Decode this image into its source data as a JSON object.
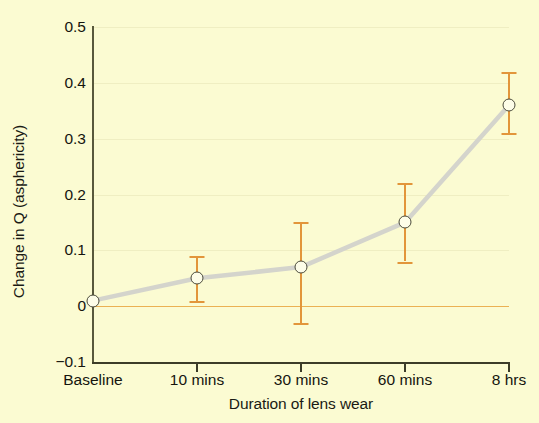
{
  "chart_data": {
    "type": "line",
    "title": "",
    "xlabel": "Duration of lens wear",
    "ylabel": "Change in Q (asphericity)",
    "categories": [
      "Baseline",
      "10 mins",
      "30 mins",
      "60 mins",
      "8 hrs"
    ],
    "values": [
      0.01,
      0.05,
      0.07,
      0.15,
      0.36
    ],
    "error_upper": [
      0.01,
      0.09,
      0.15,
      0.22,
      0.42
    ],
    "error_lower": [
      0.01,
      0.01,
      -0.03,
      0.08,
      0.31
    ],
    "ylim": [
      -0.1,
      0.5
    ],
    "yticks": [
      -0.1,
      0,
      0.1,
      0.2,
      0.3,
      0.4,
      0.5
    ],
    "ytick_labels": [
      "−0.1",
      "0",
      "0.1",
      "0.2",
      "0.3",
      "0.4",
      "0.5"
    ],
    "grid": true,
    "legend": "none",
    "zero_reference_line": 0,
    "marker_style": "open-circle",
    "series": [
      {
        "name": "Change in Q",
        "values": [
          0.01,
          0.05,
          0.07,
          0.15,
          0.36
        ]
      }
    ],
    "colors": {
      "background": "#fbfbd2",
      "line": "#d4d4cc",
      "errorbar": "#e2953a",
      "marker_face": "#fdfde8",
      "marker_edge": "#4a4a3a",
      "axis": "#3c3c28",
      "gridline": "#efeec2",
      "zero_line": "#e8a33d",
      "text": "#15150e"
    }
  }
}
